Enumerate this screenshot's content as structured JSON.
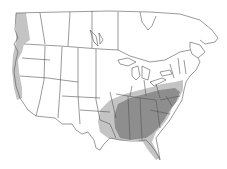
{
  "map": {
    "type": "species-range-map",
    "region": "North America (USA and southern Canada)",
    "colors": {
      "background": "#ffffff",
      "border": "#555555",
      "range_light": "#c4c4c4",
      "range_dark": "#8e8e8e"
    },
    "layers": [
      {
        "name": "pacific-coast-range",
        "shade": "light"
      },
      {
        "name": "eastern-range-outer",
        "shade": "light"
      },
      {
        "name": "southeastern-range-core",
        "shade": "dark"
      }
    ]
  }
}
